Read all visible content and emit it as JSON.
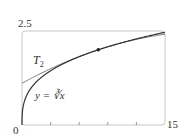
{
  "chart_data": {
    "type": "line",
    "title": "",
    "xlabel": "",
    "ylabel": "",
    "xlim": [
      0,
      15
    ],
    "ylim": [
      0,
      2.5
    ],
    "x_tick_labels": [
      "0",
      "15"
    ],
    "y_tick_labels": [
      "2.5"
    ],
    "x_minor_ticks": [
      3,
      6,
      9,
      12
    ],
    "grid": false,
    "series": [
      {
        "name": "y = ∛x",
        "function": "x^(1/3)",
        "x": [
          0,
          0.125,
          1,
          2,
          3,
          4,
          5,
          6,
          7,
          8,
          9,
          10,
          11,
          12,
          13,
          14,
          15
        ],
        "values": [
          0,
          0.5,
          1,
          1.26,
          1.442,
          1.587,
          1.71,
          1.817,
          1.913,
          2,
          2.08,
          2.154,
          2.224,
          2.289,
          2.351,
          2.41,
          2.466
        ]
      },
      {
        "name": "T2",
        "function": "2 + (x-8)/12 - (x-8)^2/288",
        "x": [
          0,
          1,
          2,
          3,
          4,
          5,
          6,
          7,
          8,
          9,
          10,
          11,
          12,
          13,
          14,
          15
        ],
        "values": [
          1.111,
          1.247,
          1.375,
          1.497,
          1.611,
          1.719,
          1.819,
          1.913,
          2,
          2.08,
          2.153,
          2.219,
          2.278,
          2.33,
          2.375,
          2.413
        ]
      }
    ],
    "annotations": [
      {
        "type": "point",
        "x": 8,
        "y": 2
      }
    ]
  },
  "labels": {
    "y_max": "2.5",
    "x_min": "0",
    "x_max": "15",
    "t2_main": "T",
    "t2_sub": "2",
    "curve": "y = ∛x"
  }
}
